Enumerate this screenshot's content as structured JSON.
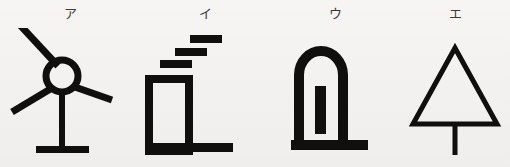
{
  "figure": {
    "background_color": "#f4f3f1",
    "ink_color": "#100f0e",
    "choice_count": 4
  },
  "choices": [
    {
      "label": "ア",
      "symbol_name": "wind-turbine-symbol",
      "description": "Wind turbine: circular hub with three radiating blades on a vertical mast with a horizontal base"
    },
    {
      "label": "イ",
      "symbol_name": "factory-symbol",
      "description": "Factory: tall outlined rectangle on a thick ground line with three stepped smoke bars rising to the right"
    },
    {
      "label": "ウ",
      "symbol_name": "arch-monument-symbol",
      "description": "Round-topped arch with a solid vertical bar inside standing on a ground line"
    },
    {
      "label": "エ",
      "symbol_name": "tree-symbol",
      "description": "Outlined triangle with a vertical trunk descending from the centre of its base"
    }
  ]
}
